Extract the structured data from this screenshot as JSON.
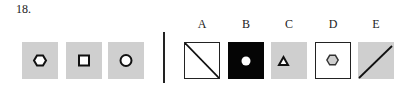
{
  "question": {
    "number": "18."
  },
  "sequence": [
    {
      "background": "gray",
      "shape": "hexagon"
    },
    {
      "background": "gray",
      "shape": "square"
    },
    {
      "background": "gray",
      "shape": "circle"
    }
  ],
  "options": [
    {
      "label": "A",
      "background": "white",
      "shape": "diagonal-line-top-left-to-bottom-right"
    },
    {
      "label": "B",
      "background": "black",
      "shape": "filled-white-circle"
    },
    {
      "label": "C",
      "background": "gray",
      "shape": "triangle"
    },
    {
      "label": "D",
      "background": "white",
      "shape": "hexagon-gray-fill"
    },
    {
      "label": "E",
      "background": "gray",
      "shape": "diagonal-line-bottom-left-to-top-right"
    }
  ],
  "colors": {
    "gray": "#cfcfcf",
    "black": "#050505",
    "stroke": "#222222"
  }
}
